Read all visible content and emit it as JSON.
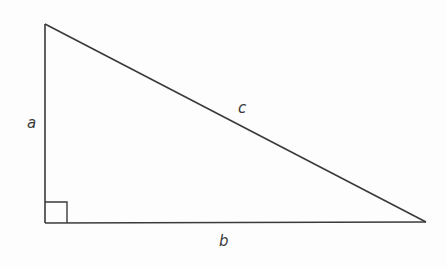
{
  "diagram": {
    "type": "right-triangle",
    "stroke_color": "#3a3a3a",
    "background_color": "#fdfdfd",
    "vertices": {
      "top": [
        45,
        24
      ],
      "bottom_left": [
        45,
        223
      ],
      "bottom_right": [
        426,
        222
      ]
    },
    "right_angle_marker": {
      "corner": "bottom_left",
      "size": 22
    },
    "labels": {
      "a": "a",
      "b": "b",
      "c": "c"
    }
  }
}
